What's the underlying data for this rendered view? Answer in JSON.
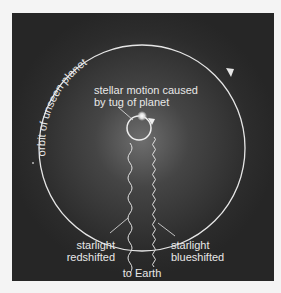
{
  "diagram": {
    "orbit_label": "orbit of unseen planet",
    "stellar_label_line1": "stellar motion caused",
    "stellar_label_line2": "by tug of planet",
    "red_label_line1": "starlight",
    "red_label_line2": "redshifted",
    "blue_label_line1": "starlight",
    "blue_label_line2": "blueshifted",
    "earth_label": "to Earth",
    "colors": {
      "background": "#f4f4f4",
      "panel": "#2a2a2a",
      "glow": "#6a6a6a",
      "line": "#e6e6e6"
    }
  }
}
